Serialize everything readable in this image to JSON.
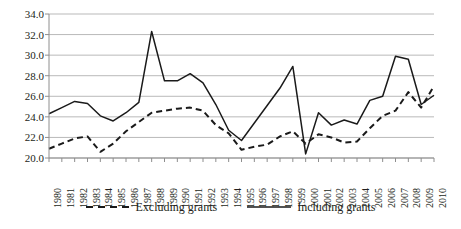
{
  "chart_data": {
    "type": "line",
    "title": "",
    "xlabel": "",
    "ylabel": "",
    "grid": "horizontal",
    "legend_position": "bottom-center",
    "ylim": [
      20.0,
      34.0
    ],
    "ytick_step": 2.0,
    "ytick_labels": [
      "34.0",
      "32.0",
      "30.0",
      "28.0",
      "26.0",
      "24.0",
      "22.0",
      "20.0"
    ],
    "ytick_values": [
      34.0,
      32.0,
      30.0,
      28.0,
      26.0,
      24.0,
      22.0,
      20.0
    ],
    "categories": [
      "1980",
      "1981",
      "1982",
      "1983",
      "1984",
      "1985",
      "1986",
      "1987",
      "1988",
      "1989",
      "1990",
      "1991",
      "1992",
      "1993",
      "1994",
      "1995",
      "1996",
      "1997",
      "1998",
      "1999",
      "2000",
      "2001",
      "2002",
      "2003",
      "2004",
      "2005",
      "2006",
      "2007",
      "2008",
      "2009",
      "2010"
    ],
    "series": [
      {
        "name": "Excluding grants",
        "style": "dashed",
        "color": "#1a1a1a",
        "values": [
          20.9,
          21.4,
          21.9,
          22.1,
          20.6,
          21.4,
          22.6,
          23.5,
          24.4,
          24.6,
          24.8,
          24.9,
          24.6,
          23.2,
          22.4,
          20.8,
          21.1,
          21.3,
          22.1,
          22.6,
          21.4,
          22.3,
          22.0,
          21.5,
          21.6,
          22.9,
          24.1,
          24.6,
          26.4,
          24.9,
          27.0
        ]
      },
      {
        "name": "Including grants",
        "style": "solid",
        "color": "#1a1a1a",
        "values": [
          24.3,
          24.9,
          25.5,
          25.3,
          24.1,
          23.6,
          24.4,
          25.4,
          32.3,
          27.5,
          27.5,
          28.2,
          27.3,
          25.2,
          22.7,
          21.7,
          23.4,
          25.1,
          26.8,
          28.9,
          20.4,
          24.4,
          23.2,
          23.7,
          23.3,
          25.6,
          26.0,
          29.9,
          29.6,
          25.2,
          26.1
        ]
      }
    ]
  },
  "legend": {
    "entries": [
      {
        "label": "Excluding grants"
      },
      {
        "label": "Including grants"
      }
    ]
  }
}
